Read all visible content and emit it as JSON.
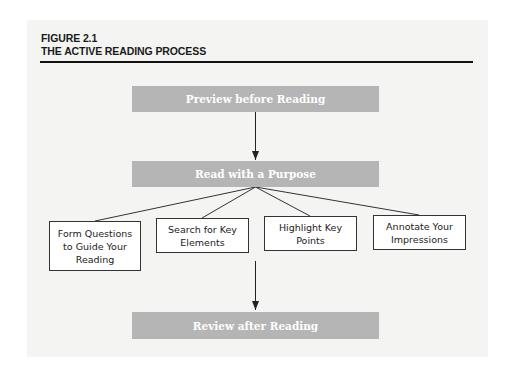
{
  "figure": {
    "label": "FIGURE 2.1",
    "title": "THE ACTIVE READING PROCESS"
  },
  "steps": {
    "preview": "Preview before Reading",
    "read": "Read with a Purpose",
    "review": "Review after Reading"
  },
  "substeps": [
    {
      "label": "Form Questions to Guide Your Reading"
    },
    {
      "label": "Search for Key Elements"
    },
    {
      "label": "Highlight Key Points"
    },
    {
      "label": "Annotate Your Impressions"
    }
  ],
  "colors": {
    "panel_bg": "#f4f4f3",
    "step_bar": "#b5b5b5",
    "step_text": "#ffffff",
    "lines": "#222222"
  }
}
